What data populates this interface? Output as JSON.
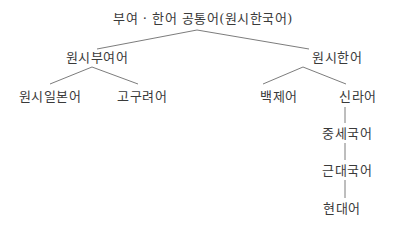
{
  "diagram": {
    "type": "language-family-tree",
    "line_color": "#5a5a5a",
    "nodes": {
      "root": {
        "label": "부여 · 한어 공통어(원시한국어)"
      },
      "proto_buyeo": {
        "label": "원시부여어"
      },
      "proto_han": {
        "label": "원시한어"
      },
      "proto_japanese": {
        "label": "원시일본어"
      },
      "goguryeo": {
        "label": "고구려어"
      },
      "baekje": {
        "label": "백제어"
      },
      "silla": {
        "label": "신라어"
      },
      "middle_korean": {
        "label": "중세국어"
      },
      "early_modern_korean": {
        "label": "근대국어"
      },
      "modern_korean": {
        "label": "현대어"
      }
    },
    "edges": [
      [
        "root",
        "proto_buyeo"
      ],
      [
        "root",
        "proto_han"
      ],
      [
        "proto_buyeo",
        "proto_japanese"
      ],
      [
        "proto_buyeo",
        "goguryeo"
      ],
      [
        "proto_han",
        "baekje"
      ],
      [
        "proto_han",
        "silla"
      ],
      [
        "silla",
        "middle_korean"
      ],
      [
        "middle_korean",
        "early_modern_korean"
      ],
      [
        "early_modern_korean",
        "modern_korean"
      ]
    ]
  }
}
